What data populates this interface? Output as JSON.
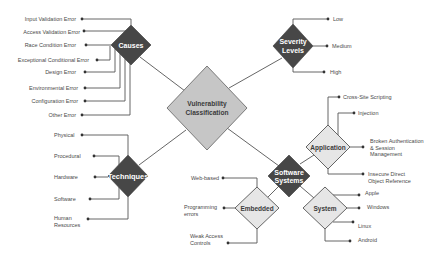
{
  "colors": {
    "dark_node": "#474747",
    "light_node": "#e6e6e6",
    "root_node": "#c6c6c6",
    "line": "#555555"
  },
  "diagram": {
    "root": {
      "lines": [
        "Vulnerability",
        "Classification"
      ]
    },
    "causes": {
      "label": "Causes",
      "children": [
        "Input Validation Error",
        "Access Validation Error",
        "Race Condition Error",
        "Exceptional Conditional Error",
        "Design Error",
        "Environmental Error",
        "Configuration Error",
        "Other Error"
      ]
    },
    "severity": {
      "lines": [
        "Severity",
        "Levels"
      ],
      "children": [
        "Low",
        "Medium",
        "High"
      ]
    },
    "techniques": {
      "label": "Techniques",
      "children": [
        [
          "Physical"
        ],
        [
          "Procedural"
        ],
        [
          "Hardware"
        ],
        [
          "Software"
        ],
        [
          "Human",
          "Resources"
        ]
      ]
    },
    "software_systems": {
      "lines": [
        "Software",
        "Systems"
      ],
      "application": {
        "label": "Application",
        "children": [
          [
            "Cross-Site Scripting"
          ],
          [
            "Injection"
          ],
          [
            "Broken Authentication",
            "& Session",
            "Management"
          ],
          [
            "Insecure Direct",
            "Object Reference"
          ]
        ]
      },
      "embedded": {
        "label": "Embedded",
        "children": [
          [
            "Web-based"
          ],
          [
            "Programming",
            "errors"
          ],
          [
            "Weak Access",
            "Controls"
          ]
        ]
      },
      "system": {
        "label": "System",
        "children": [
          [
            "Apple"
          ],
          [
            "Windows"
          ],
          [
            "Linux"
          ],
          [
            "Android"
          ]
        ]
      }
    }
  }
}
